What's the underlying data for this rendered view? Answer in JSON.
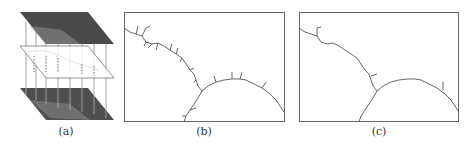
{
  "figure": {
    "panels": [
      {
        "id": "a",
        "caption": "(a)",
        "description": "Stacked layers: two textured grayscale image planes with a transparent middle plane and vertical connecting lines"
      },
      {
        "id": "b",
        "caption": "(b)",
        "description": "Extracted boundary curves with many short branch spurs"
      },
      {
        "id": "c",
        "caption": "(c)",
        "description": "Pruned boundary curves with few branch spurs"
      }
    ],
    "colors": {
      "plane_dark": "#4a4a4a",
      "plane_light": "#8a8a8a",
      "line": "#555555",
      "border": "#666666",
      "vertical": "#9a9a9a"
    }
  }
}
